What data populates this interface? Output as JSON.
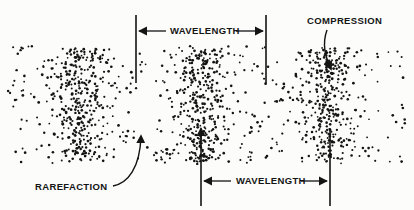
{
  "figure": {
    "background_color": "#fcfcfb",
    "ink_color": "#141414"
  },
  "labels": {
    "wavelength_top": "WAVELENGTH",
    "wavelength_bottom": "WAVELENGTH",
    "compression": "COMPRESSION",
    "rarefaction": "RAREFACTION"
  },
  "chart_data": {
    "type": "scatter",
    "xlabel": "",
    "ylabel": "",
    "xlim": [
      0,
      414
    ],
    "ylim": [
      0,
      210
    ],
    "grid": false,
    "legend": "none",
    "field": {
      "x_start": 8,
      "x_end": 406,
      "y_start": 52,
      "y_end": 158,
      "base_density_dots": 330,
      "dot_radius": 1.1,
      "dot_color": "#141414"
    },
    "compressions": [
      {
        "name": "compression-1",
        "center_x": 80,
        "sigma_x": 17,
        "dots": 230
      },
      {
        "name": "compression-2",
        "center_x": 202,
        "sigma_x": 17,
        "dots": 230
      },
      {
        "name": "compression-3",
        "center_x": 327,
        "sigma_x": 16,
        "dots": 210
      }
    ],
    "rarefactions": [
      {
        "name": "rarefaction-1",
        "center_x": 140
      },
      {
        "name": "rarefaction-2",
        "center_x": 264
      }
    ],
    "wavelength_markers": [
      {
        "name": "wavelength-top",
        "left_line_x": 136,
        "right_line_x": 266,
        "line_y_top": 15,
        "line_y_bottom": 83,
        "arrow_y": 31,
        "value_px": 130
      },
      {
        "name": "wavelength-bottom",
        "left_line_x": 201,
        "right_line_x": 330,
        "line_y_top": 128,
        "line_y_bottom": 206,
        "arrow_y": 181,
        "value_px": 129
      }
    ],
    "annotations": [
      {
        "name": "compression",
        "text": "COMPRESSION",
        "points_to_x": 330,
        "points_to_y": 70
      },
      {
        "name": "rarefaction",
        "text": "RAREFACTION",
        "points_to_x": 141,
        "points_to_y": 133
      }
    ]
  }
}
